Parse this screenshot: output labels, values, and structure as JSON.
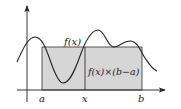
{
  "figure": {
    "curve_label": "f(x)",
    "area_label": "f(x)×(b−a)",
    "axis_labels": {
      "a": "a",
      "x": "x",
      "b": "b"
    },
    "colors": {
      "rect_fill": "#d6d6d6",
      "stroke": "#222222",
      "background": "#ffffff"
    }
  }
}
